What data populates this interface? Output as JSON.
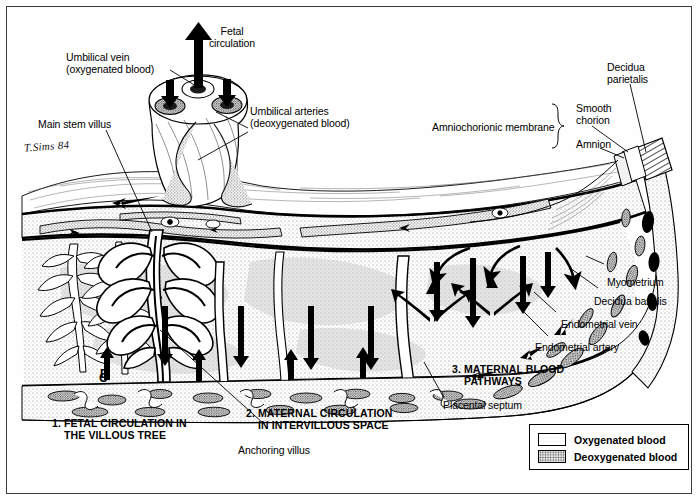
{
  "figure": {
    "signature": "T.Sims 84"
  },
  "labels": {
    "fetal_circulation": "Fetal\ncirculation",
    "umbilical_vein": "Umbilical vein\n(oxygenated blood)",
    "main_stem_villus": "Main stem villus",
    "umbilical_arteries": "Umbilical arteries\n(deoxygenated blood)",
    "amniochorionic_membrane": "Amniochorionic membrane",
    "smooth_chorion": "Smooth\nchorion",
    "amnion": "Amnion",
    "decidua_parietalis": "Decidua\nparietalis",
    "myometrium": "Myometrium",
    "decidua_basalis": "Decidua basalis",
    "endometrial_vein": "Endometrial vein",
    "endometrial_artery": "Endometrial artery",
    "placental_septum": "Placental septum",
    "anchoring_villus": "Anchoring villus",
    "marker_c": "C",
    "marker_d": "D"
  },
  "captions": {
    "one": "1. FETAL CIRCULATION IN\n    THE VILLOUS TREE",
    "two": "2. MATERNAL CIRCULATION\n    IN INTERVILLOUS SPACE",
    "three": "3. MATERNAL BLOOD\n    PATHWAYS"
  },
  "legend": {
    "items": [
      {
        "label": "Oxygenated blood",
        "fill": "#ffffff",
        "pattern": "light-stipple"
      },
      {
        "label": "Deoxygenated blood",
        "fill": "#b8b8b8",
        "pattern": "dense-stipple"
      }
    ]
  },
  "colors": {
    "ink": "#000000",
    "frame": "#3c3c3c",
    "paper": "#fefefe",
    "stipple_light": "#d8d8d8",
    "stipple_dense": "#9a9a9a"
  }
}
